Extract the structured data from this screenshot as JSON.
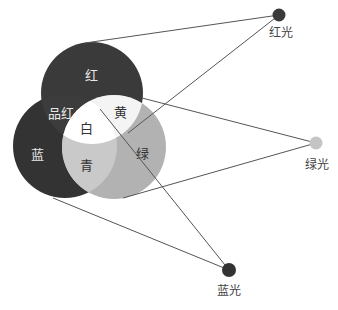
{
  "diagram": {
    "colors": {
      "red_circle": "#3a3a3a",
      "blue_circle": "#333333",
      "green_circle": "#b2b2b2",
      "magenta_overlap": "#3c3c3c",
      "yellow_overlap": "#f4f4f4",
      "cyan_overlap": "#c9c9c9",
      "white_center": "#ffffff",
      "red_dot": "#3a3a3a",
      "green_dot": "#c4c4c4",
      "blue_dot": "#333333",
      "line": "#555555"
    },
    "regions": {
      "red": "红",
      "green": "绿",
      "blue": "蓝",
      "yellow": "黄",
      "magenta": "品红",
      "cyan": "青",
      "white": "白"
    },
    "sources": {
      "red_light": "红光",
      "green_light": "绿光",
      "blue_light": "蓝光"
    },
    "caption": "图 … 色光三原色"
  }
}
